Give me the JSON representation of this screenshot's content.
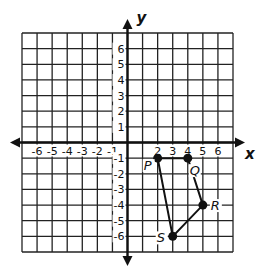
{
  "diagram": {
    "type": "coordinate-plane",
    "axes": {
      "x_label": "x",
      "y_label": "y"
    },
    "x_range": [
      -7,
      7
    ],
    "y_range": [
      -7,
      7
    ],
    "x_tick_labels": [
      "-6",
      "-5",
      "-4",
      "-3",
      "-2",
      "-1",
      "2",
      "3",
      "4",
      "5",
      "6"
    ],
    "y_tick_labels": [
      "6",
      "5",
      "4",
      "3",
      "2",
      "1",
      "-1",
      "-2",
      "-3",
      "-4",
      "-5",
      "-6"
    ],
    "points": [
      {
        "label": "P",
        "x": 2,
        "y": -1
      },
      {
        "label": "Q",
        "x": 4,
        "y": -1
      },
      {
        "label": "R",
        "x": 5,
        "y": -4
      },
      {
        "label": "S",
        "x": 3,
        "y": -6
      }
    ],
    "polygon": [
      "P",
      "Q",
      "R",
      "S"
    ],
    "colors": {
      "line": "#111111",
      "grid": "#222222",
      "background": "#ffffff"
    }
  }
}
